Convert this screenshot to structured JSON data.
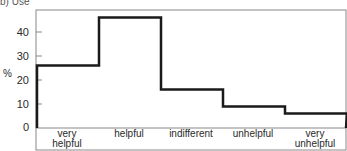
{
  "caption": "b) Use",
  "chart_data": {
    "type": "bar",
    "style": "step-histogram",
    "title": "",
    "xlabel": "",
    "ylabel": "%",
    "categories": [
      "very helpful",
      "helpful",
      "indifferent",
      "unhelpful",
      "very unhelpful"
    ],
    "category_lines": [
      [
        "very",
        "helpful"
      ],
      [
        "helpful"
      ],
      [
        "indifferent"
      ],
      [
        "unhelpful"
      ],
      [
        "very",
        "unhelpful"
      ]
    ],
    "values": [
      26,
      46,
      16,
      9,
      6
    ],
    "yticks": [
      0,
      10,
      20,
      30,
      40
    ],
    "ylim": [
      0,
      48
    ],
    "grid": false,
    "legend": null,
    "line_color": "#1a1a1a"
  }
}
